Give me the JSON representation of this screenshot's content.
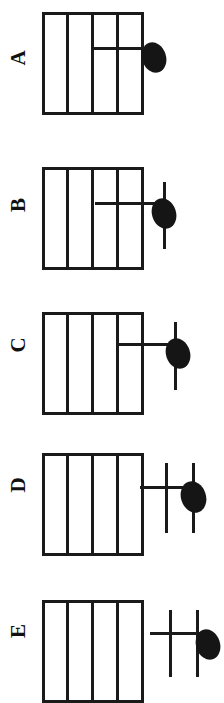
{
  "diagram": {
    "orientation": "rotated-90-counterclockwise",
    "staff_line_count": 5,
    "ink_color": "#1a1a1a",
    "notehead_color": "#151515",
    "background_color": "#ffffff"
  },
  "options": [
    {
      "label": "A",
      "notehead": "filled-notehead",
      "ledger_lines": 1,
      "extra_strokes": 0,
      "note_position": "one ledger line beyond the staff"
    },
    {
      "label": "B",
      "notehead": "filled-notehead",
      "ledger_lines": 1,
      "extra_strokes": 1,
      "note_position": "one ledger line beyond the staff, with crossing stroke"
    },
    {
      "label": "C",
      "notehead": "filled-notehead",
      "ledger_lines": 1,
      "extra_strokes": 1,
      "note_position": "one ledger line beyond the staff, with crossing stroke"
    },
    {
      "label": "D",
      "notehead": "filled-notehead",
      "ledger_lines": 1,
      "extra_strokes": 2,
      "note_position": "two ledger lines beyond the staff"
    },
    {
      "label": "E",
      "notehead": "filled-notehead",
      "ledger_lines": 1,
      "extra_strokes": 2,
      "note_position": "two ledger lines beyond the staff, furthest out"
    }
  ]
}
